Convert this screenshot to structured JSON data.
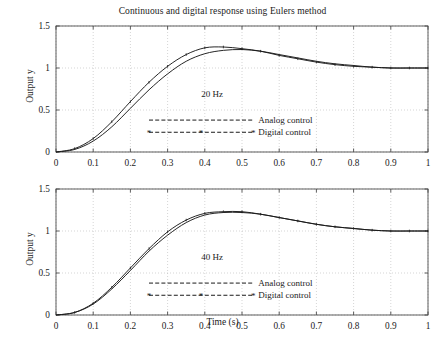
{
  "figure": {
    "title": "Continuous and digital response using Eulers method",
    "background": "#ffffff",
    "axis_color": "#4d4d4d",
    "grid_color": "#b9b9b9",
    "curve_color": "#1a1a1a"
  },
  "axes": {
    "xlabel": "Time (s)",
    "ylabel": "Output y",
    "xticks": [
      "0",
      "0.1",
      "0.2",
      "0.3",
      "0.4",
      "0.5",
      "0.6",
      "0.7",
      "0.8",
      "0.9",
      "1"
    ],
    "yticks": [
      "0",
      "0.5",
      "1",
      "1.5"
    ],
    "xlim": [
      0,
      1
    ],
    "ylim": [
      0,
      1.5
    ]
  },
  "legend": {
    "analog_label": "Analog control",
    "digital_label": "Digital control",
    "analog_style": "dashed-line",
    "digital_style": "dashed-line-with-asterisk-markers"
  },
  "panels": [
    {
      "id": "top",
      "annotation": "20 Hz"
    },
    {
      "id": "bottom",
      "annotation": "40 Hz"
    }
  ],
  "chart_data": {
    "type": "line",
    "title": "Continuous and digital response using Eulers method",
    "xlabel": "Time (s)",
    "ylabel": "Output y",
    "xlim": [
      0,
      1
    ],
    "ylim": [
      0,
      1.5
    ],
    "xticks": [
      0,
      0.1,
      0.2,
      0.3,
      0.4,
      0.5,
      0.6,
      0.7,
      0.8,
      0.9,
      1
    ],
    "yticks": [
      0,
      0.5,
      1,
      1.5
    ],
    "grid": true,
    "legend_position": "center",
    "subplots": [
      {
        "annotation": "20 Hz",
        "x": [
          0,
          0.05,
          0.1,
          0.15,
          0.2,
          0.25,
          0.3,
          0.35,
          0.4,
          0.45,
          0.5,
          0.55,
          0.6,
          0.65,
          0.7,
          0.75,
          0.8,
          0.85,
          0.9,
          0.95,
          1
        ],
        "series": [
          {
            "name": "Analog control",
            "values": [
              0,
              0.03,
              0.13,
              0.3,
              0.52,
              0.74,
              0.93,
              1.08,
              1.17,
              1.21,
              1.22,
              1.2,
              1.16,
              1.12,
              1.08,
              1.05,
              1.03,
              1.01,
              1.0,
              1.0,
              1.0
            ]
          },
          {
            "name": "Digital control",
            "values": [
              0,
              0.04,
              0.16,
              0.36,
              0.6,
              0.83,
              1.02,
              1.16,
              1.24,
              1.25,
              1.23,
              1.2,
              1.15,
              1.11,
              1.07,
              1.04,
              1.02,
              1.01,
              1.0,
              1.0,
              1.0
            ]
          }
        ]
      },
      {
        "annotation": "40 Hz",
        "x": [
          0,
          0.05,
          0.1,
          0.15,
          0.2,
          0.25,
          0.3,
          0.35,
          0.4,
          0.45,
          0.5,
          0.55,
          0.6,
          0.65,
          0.7,
          0.75,
          0.8,
          0.85,
          0.9,
          0.95,
          1
        ],
        "series": [
          {
            "name": "Analog control",
            "values": [
              0,
              0.03,
              0.13,
              0.31,
              0.53,
              0.76,
              0.95,
              1.1,
              1.19,
              1.22,
              1.22,
              1.2,
              1.16,
              1.12,
              1.08,
              1.05,
              1.03,
              1.01,
              1.0,
              1.0,
              1.0
            ]
          },
          {
            "name": "Digital control",
            "values": [
              0,
              0.03,
              0.14,
              0.33,
              0.56,
              0.79,
              0.99,
              1.13,
              1.21,
              1.23,
              1.23,
              1.2,
              1.16,
              1.12,
              1.08,
              1.05,
              1.03,
              1.01,
              1.0,
              1.0,
              1.0
            ]
          }
        ]
      }
    ]
  }
}
